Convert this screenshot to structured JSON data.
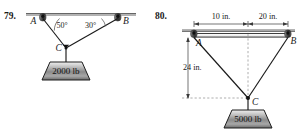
{
  "figure": {
    "caption_style": "textbook-statics-problem-pair",
    "problems": [
      {
        "number": "79.",
        "points": {
          "a": "A",
          "b": "B",
          "c": "C"
        },
        "angles": {
          "left": "50°",
          "right": "30°"
        },
        "load": "2000 lb",
        "support": "ceiling-line"
      },
      {
        "number": "80.",
        "points": {
          "a": "A",
          "b": "B",
          "c": "C"
        },
        "dimensions": {
          "top_left": "10 in.",
          "top_right": "20 in.",
          "vertical": "24 in."
        },
        "load": "5000 lb",
        "support": "ceiling-line"
      }
    ]
  },
  "colors": {
    "ink": "#1a1a1a",
    "rule": "#555555",
    "dashed": "#9a9a9a",
    "block_light": "#d9d9d9",
    "block_dark": "#6e6e6e",
    "pin_dark": "#3d3d3d"
  }
}
